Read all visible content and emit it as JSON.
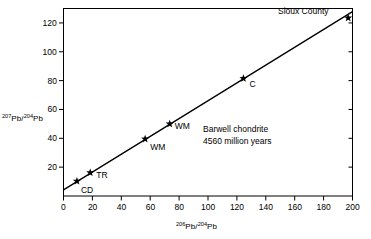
{
  "figure": {
    "background": "#ffffff",
    "ink_color": "#000000"
  },
  "annotation": {
    "line1": "Barwell chondrite",
    "line2": "4560 million years"
  },
  "corner_label": "Sioux County",
  "axis_titles": {
    "y_sup1": "207",
    "y_base1": "Pb/",
    "y_sup2": "204",
    "y_base2": "Pb",
    "x_sup1": "206",
    "x_base1": "Pb/",
    "x_sup2": "204",
    "x_base2": "Pb"
  },
  "chart_data": {
    "type": "scatter",
    "title": "",
    "subtitle": "",
    "xlabel": "206Pb/204Pb",
    "ylabel": "207Pb/204Pb",
    "xlim": [
      0,
      200
    ],
    "ylim": [
      0,
      130
    ],
    "xticks": [
      0,
      20,
      40,
      60,
      80,
      100,
      120,
      140,
      160,
      180,
      200
    ],
    "xtick_labels": [
      "0",
      "20",
      "40",
      "60",
      "80",
      "100",
      "120",
      "140",
      "160",
      "180",
      "200"
    ],
    "yticks": [
      20,
      40,
      60,
      80,
      100,
      120
    ],
    "ytick_labels": [
      "20",
      "40",
      "60",
      "80",
      "100",
      "120"
    ],
    "grid": false,
    "legend": "none",
    "marker": "star",
    "points": [
      {
        "label": "CD",
        "x": 9.3,
        "y": 10.3,
        "label_dx": 4,
        "label_dy": 9
      },
      {
        "label": "TR",
        "x": 18.5,
        "y": 16.2,
        "label_dx": 6,
        "label_dy": 2
      },
      {
        "label": "WM",
        "x": 56.5,
        "y": 39.5,
        "label_dx": 5,
        "label_dy": 8
      },
      {
        "label": "WM",
        "x": 73.5,
        "y": 50.0,
        "label_dx": 5,
        "label_dy": 2
      },
      {
        "label": "C",
        "x": 124.5,
        "y": 81.5,
        "label_dx": 6,
        "label_dy": 6
      },
      {
        "label": "Sioux County",
        "x": 197.0,
        "y": 123.5,
        "label_dx": 0,
        "label_dy": 0
      }
    ],
    "isochron_line": {
      "name": "Barwell chondrite isochron",
      "x_start": 0.0,
      "y_start": 4.2,
      "x_end": 200.0,
      "y_end": 127.8,
      "slope": 0.618,
      "intercept": 4.2,
      "age_label": "4560 million years"
    }
  }
}
